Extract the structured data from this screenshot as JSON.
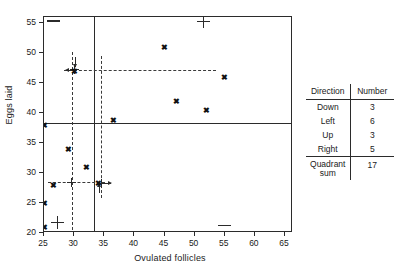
{
  "chart_data": {
    "type": "scatter",
    "title": "",
    "xlabel": "Ovulated follicles",
    "ylabel": "Eggs laid",
    "xlim": [
      24,
      66
    ],
    "ylim": [
      19.5,
      57.5
    ],
    "xticks": [
      25,
      30,
      35,
      40,
      45,
      50,
      55,
      60,
      65
    ],
    "yticks": [
      20,
      25,
      30,
      35,
      40,
      45,
      50,
      55
    ],
    "grid": false,
    "legend": "none",
    "points": [
      {
        "x": 25,
        "y": 38
      },
      {
        "x": 25,
        "y": 25
      },
      {
        "x": 25,
        "y": 21
      },
      {
        "x": 26.5,
        "y": 28
      },
      {
        "x": 29,
        "y": 34
      },
      {
        "x": 30,
        "y": 47
      },
      {
        "x": 32,
        "y": 31
      },
      {
        "x": 34,
        "y": 28.3
      },
      {
        "x": 36.5,
        "y": 38.8
      },
      {
        "x": 45,
        "y": 51
      },
      {
        "x": 47,
        "y": 42
      },
      {
        "x": 52,
        "y": 40.5
      },
      {
        "x": 55,
        "y": 46
      },
      {
        "x": 65,
        "y": 56.5
      }
    ],
    "median_lines": {
      "x": 33.3,
      "y": 38.3
    },
    "hinge_lines": {
      "x": [
        29.6,
        34.5
      ],
      "y": [
        47.2,
        28.5
      ]
    },
    "cross_markers": [
      {
        "x": 30,
        "y": 47.2
      },
      {
        "x": 29.6,
        "y": 28.5
      },
      {
        "x": 34.5,
        "y": 28.3
      },
      {
        "x": 27.2,
        "y": 21.7
      },
      {
        "x": 51.5,
        "y": 55.2
      }
    ],
    "dash_markers": [
      {
        "x": 26.5,
        "y": 55.3
      },
      {
        "x": 55,
        "y": 21.2
      }
    ]
  },
  "summary_table": {
    "headers": [
      "Direction",
      "Number"
    ],
    "rows": [
      {
        "direction": "Down",
        "number": "3"
      },
      {
        "direction": "Left",
        "number": "6"
      },
      {
        "direction": "Up",
        "number": "3"
      },
      {
        "direction": "Right",
        "number": "5"
      }
    ],
    "total": {
      "label_line1": "Quadrant",
      "label_line2": "sum",
      "number": "17"
    }
  }
}
